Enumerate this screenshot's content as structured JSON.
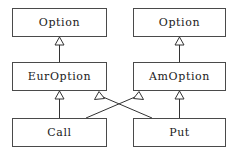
{
  "diagram": {
    "type": "uml-class-diagram",
    "notation": "generalization",
    "background_color": "#ffffff",
    "border_color": "#4a4a4a",
    "line_color": "#333333",
    "text_color": "#1a1a1a",
    "classes": [
      {
        "id": "option-left",
        "label": "Option",
        "x": 12,
        "y": 8,
        "w": 95,
        "h": 29
      },
      {
        "id": "option-right",
        "label": "Option",
        "x": 133,
        "y": 8,
        "w": 93,
        "h": 29
      },
      {
        "id": "eur-option",
        "label": "EurOption",
        "x": 12,
        "y": 62,
        "w": 95,
        "h": 29
      },
      {
        "id": "am-option",
        "label": "AmOption",
        "x": 133,
        "y": 62,
        "w": 93,
        "h": 29
      },
      {
        "id": "call",
        "label": "Call",
        "x": 12,
        "y": 118,
        "w": 95,
        "h": 29
      },
      {
        "id": "put",
        "label": "Put",
        "x": 133,
        "y": 118,
        "w": 93,
        "h": 29
      }
    ],
    "relationships": [
      {
        "id": "eur-extends-option",
        "from": "EurOption",
        "to": "Option",
        "kind": "generalization",
        "arrow": "hollow-triangle"
      },
      {
        "id": "am-extends-option",
        "from": "AmOption",
        "to": "Option",
        "kind": "generalization",
        "arrow": "hollow-triangle"
      },
      {
        "id": "call-extends-eur",
        "from": "Call",
        "to": "EurOption",
        "kind": "generalization",
        "arrow": "hollow-triangle"
      },
      {
        "id": "call-extends-am",
        "from": "Call",
        "to": "AmOption",
        "kind": "generalization",
        "arrow": "hollow-triangle"
      },
      {
        "id": "put-extends-eur",
        "from": "Put",
        "to": "EurOption",
        "kind": "generalization",
        "arrow": "hollow-triangle"
      },
      {
        "id": "put-extends-am",
        "from": "Put",
        "to": "AmOption",
        "kind": "generalization",
        "arrow": "hollow-triangle"
      }
    ]
  }
}
